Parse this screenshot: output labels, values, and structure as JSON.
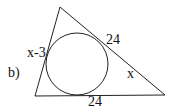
{
  "problem_label": "b)",
  "labels": {
    "left_side": "x-3",
    "upper_right_side": "24",
    "lower_right_side": "x",
    "bottom_side": "24"
  },
  "colors": {
    "stroke": "#222222",
    "text": "#111111"
  }
}
